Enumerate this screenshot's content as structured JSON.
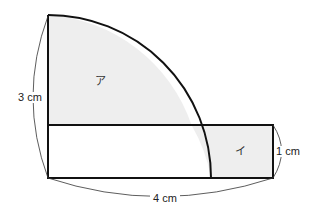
{
  "figure": {
    "labels": {
      "height_left": "3 cm",
      "width_bottom": "4 cm",
      "height_right": "1 cm",
      "region_a": "ア",
      "region_i": "イ"
    },
    "colors": {
      "stroke": "#111111",
      "shade": "#eeeeee"
    }
  }
}
